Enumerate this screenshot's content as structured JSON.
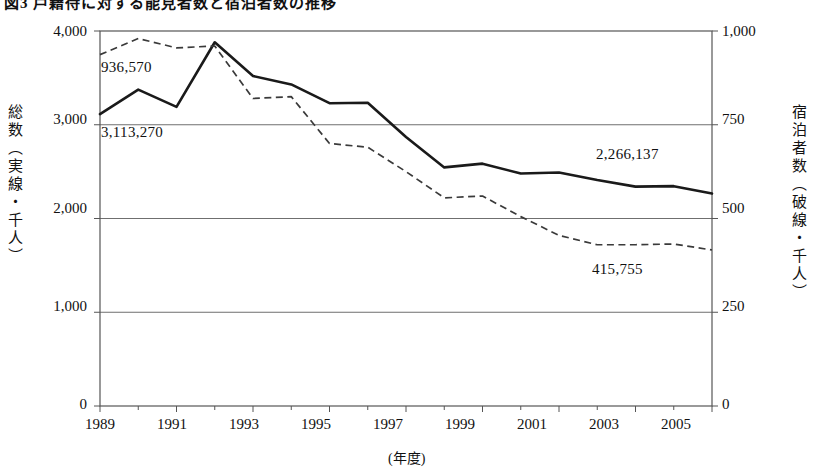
{
  "figure": {
    "title": "図3 戸籍待に対する能見者数と宿泊者数の推移",
    "x_unit_label": "(年度)"
  },
  "axes": {
    "left": {
      "label": "総数（実線・千人）",
      "ticks": [
        "0",
        "1,000",
        "2,000",
        "3,000",
        "4,000"
      ],
      "min": 0,
      "max": 4000
    },
    "right": {
      "label": "宿泊者数（破線・千人）",
      "ticks": [
        "0",
        "250",
        "500",
        "750",
        "1,000"
      ],
      "min": 0,
      "max": 1000
    },
    "x": {
      "ticks": [
        "1989",
        "1991",
        "1993",
        "1995",
        "1997",
        "1999",
        "2001",
        "2003",
        "2005"
      ]
    }
  },
  "annotations": [
    {
      "name": "dashed-start-value",
      "text": "936,570",
      "x": 101,
      "y": 59
    },
    {
      "name": "solid-start-value",
      "text": "3,113,270",
      "x": 101,
      "y": 124
    },
    {
      "name": "solid-end-value",
      "text": "2,266,137",
      "x": 596,
      "y": 146
    },
    {
      "name": "dashed-end-value",
      "text": "415,755",
      "x": 592,
      "y": 261
    }
  ],
  "colors": {
    "line_solid": "#1a1a1a",
    "line_dashed": "#3a3a3a",
    "frame": "#555555",
    "grid": "#6f6f6f",
    "text": "#111111"
  },
  "chart_data": {
    "type": "line",
    "title": "図3 戸籍待に対する能見者数と宿泊者数の推移",
    "xlabel": "(年度)",
    "ylabel": "総数（実線・千人）",
    "y2label": "宿泊者数（破線・千人）",
    "grid": true,
    "legend": "none (series identified by line style annotations)",
    "ylim": [
      0,
      4000
    ],
    "y2lim": [
      0,
      1000
    ],
    "x": [
      1989,
      1990,
      1991,
      1992,
      1993,
      1994,
      1995,
      1996,
      1997,
      1998,
      1999,
      2000,
      2001,
      2002,
      2003,
      2004,
      2005
    ],
    "series": [
      {
        "name": "総数（実線・千人）",
        "style": "solid",
        "axis": "left",
        "unit": "千人",
        "start_value_label": "3,113,270",
        "end_value_label": "2,266,137",
        "values": [
          3113,
          3375,
          3190,
          3880,
          3520,
          3430,
          3230,
          3235,
          2870,
          2545,
          2585,
          2480,
          2490,
          2410,
          2340,
          2345,
          2266
        ]
      },
      {
        "name": "宿泊者数（破線・千人）",
        "style": "dashed",
        "axis": "right",
        "unit": "千人",
        "start_value_label": "936,570",
        "end_value_label": "415,755",
        "values": [
          937,
          980,
          955,
          960,
          820,
          825,
          700,
          690,
          625,
          555,
          560,
          505,
          455,
          430,
          430,
          432,
          416
        ]
      }
    ]
  }
}
